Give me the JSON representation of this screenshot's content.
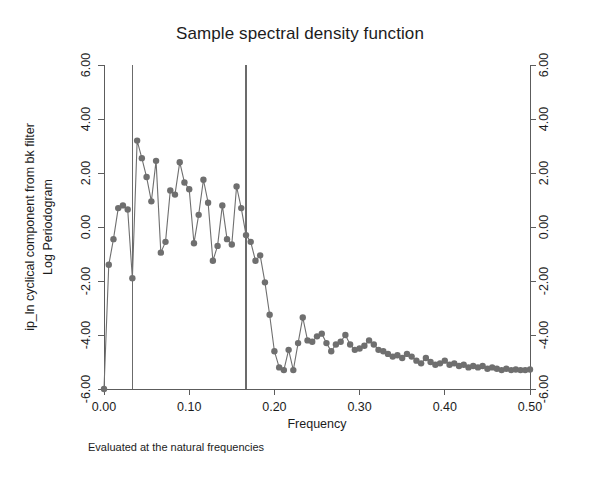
{
  "chart_data": {
    "type": "line",
    "title": "Sample spectral density function",
    "subtitle": "",
    "xlabel": "Frequency",
    "ylabel_line1": "ip_ln cyclical component from bk filter",
    "ylabel_line2": "Log Periodogram",
    "note": "Evaluated at the natural frequencies",
    "xlim": [
      0.0,
      0.5
    ],
    "ylim": [
      -6.0,
      6.0
    ],
    "grid": false,
    "legend": "none",
    "marker": "filled-circle",
    "series_color": "#6f6f6f",
    "xticks": [
      "0.00",
      "0.10",
      "0.20",
      "0.30",
      "0.40",
      "0.50"
    ],
    "xtick_values": [
      0.0,
      0.1,
      0.2,
      0.3,
      0.4,
      0.5
    ],
    "yticks": [
      "6.00",
      "4.00",
      "2.00",
      "0.00",
      "-2.00",
      "-4.00",
      "-6.00"
    ],
    "ytick_values": [
      6.0,
      4.0,
      2.0,
      0.0,
      -2.0,
      -4.0,
      -6.0
    ],
    "right_axis_yticks": [
      "6.00",
      "4.00",
      "2.00",
      "0.00",
      "-2.00",
      "-4.00",
      "-6.00"
    ],
    "reference_lines": [
      {
        "axis": "x",
        "value": 0.0333,
        "color": "#6b6b6b"
      },
      {
        "axis": "x",
        "value": 0.1667,
        "color": "#6b6b6b"
      }
    ],
    "x": [
      0.0,
      0.0056,
      0.0111,
      0.0167,
      0.0222,
      0.0278,
      0.0333,
      0.0389,
      0.0444,
      0.05,
      0.0556,
      0.0611,
      0.0667,
      0.0722,
      0.0778,
      0.0833,
      0.0889,
      0.0944,
      0.1,
      0.1056,
      0.1111,
      0.1167,
      0.1222,
      0.1278,
      0.1333,
      0.1389,
      0.1444,
      0.15,
      0.1556,
      0.1611,
      0.1667,
      0.1722,
      0.1778,
      0.1833,
      0.1889,
      0.1944,
      0.2,
      0.2056,
      0.2111,
      0.2167,
      0.2222,
      0.2278,
      0.2333,
      0.2389,
      0.2444,
      0.25,
      0.2556,
      0.2611,
      0.2667,
      0.2722,
      0.2778,
      0.2833,
      0.2889,
      0.2944,
      0.3,
      0.3056,
      0.3111,
      0.3167,
      0.3222,
      0.3278,
      0.3333,
      0.3389,
      0.3444,
      0.35,
      0.3556,
      0.3611,
      0.3667,
      0.3722,
      0.3778,
      0.3833,
      0.3889,
      0.3944,
      0.4,
      0.4056,
      0.4111,
      0.4167,
      0.4222,
      0.4278,
      0.4333,
      0.4389,
      0.4444,
      0.45,
      0.4556,
      0.4611,
      0.4667,
      0.4722,
      0.4778,
      0.4833,
      0.4889,
      0.4944,
      0.5
    ],
    "y": [
      -6.0,
      -1.4,
      -0.45,
      0.7,
      0.8,
      0.65,
      -1.9,
      3.2,
      2.55,
      1.85,
      0.95,
      2.45,
      -0.95,
      -0.55,
      1.35,
      1.2,
      2.4,
      1.65,
      1.4,
      -0.6,
      0.45,
      1.75,
      0.9,
      -1.25,
      -0.7,
      0.8,
      -0.45,
      -0.65,
      1.5,
      0.7,
      -0.3,
      -0.55,
      -1.25,
      -1.05,
      -2.05,
      -3.25,
      -4.6,
      -5.2,
      -5.3,
      -4.55,
      -5.3,
      -4.3,
      -3.35,
      -4.2,
      -4.25,
      -4.05,
      -3.95,
      -4.3,
      -4.6,
      -4.35,
      -4.25,
      -4.0,
      -4.35,
      -4.55,
      -4.5,
      -4.4,
      -4.2,
      -4.35,
      -4.55,
      -4.6,
      -4.7,
      -4.8,
      -4.75,
      -4.85,
      -4.7,
      -4.8,
      -4.95,
      -5.05,
      -4.85,
      -5.0,
      -5.1,
      -5.05,
      -4.95,
      -5.1,
      -5.05,
      -5.15,
      -5.1,
      -5.2,
      -5.15,
      -5.2,
      -5.15,
      -5.25,
      -5.2,
      -5.25,
      -5.3,
      -5.25,
      -5.3,
      -5.28,
      -5.3,
      -5.3,
      -5.28
    ]
  },
  "figure": {
    "title": "Sample spectral density function"
  }
}
